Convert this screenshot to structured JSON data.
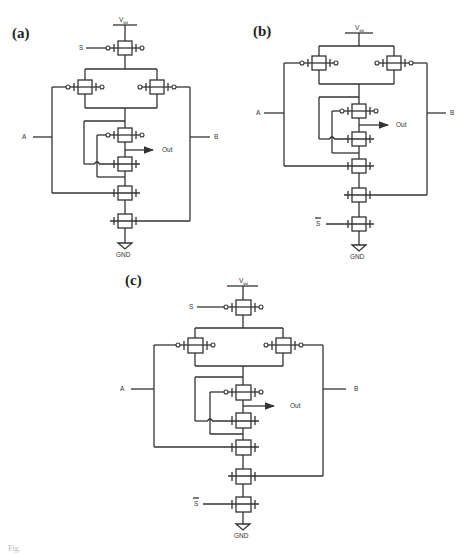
{
  "figure": {
    "panels": [
      {
        "id": "a",
        "label": "(a)",
        "supply": "V",
        "supply_sub": "dd",
        "select": "S",
        "input_a": "A",
        "input_b": "B",
        "output": "Out",
        "ground": "GND"
      },
      {
        "id": "b",
        "label": "(b)",
        "supply": "V",
        "supply_sub": "dd",
        "select": "S",
        "select_inverted": true,
        "input_a": "A",
        "input_b": "B",
        "output": "Out",
        "ground": "GND"
      },
      {
        "id": "c",
        "label": "(c)",
        "supply": "V",
        "supply_sub": "dd",
        "select": "S",
        "select_bar": "S",
        "input_a": "A",
        "input_b": "B",
        "output": "Out",
        "ground": "GND"
      }
    ],
    "caption": "Fig."
  }
}
